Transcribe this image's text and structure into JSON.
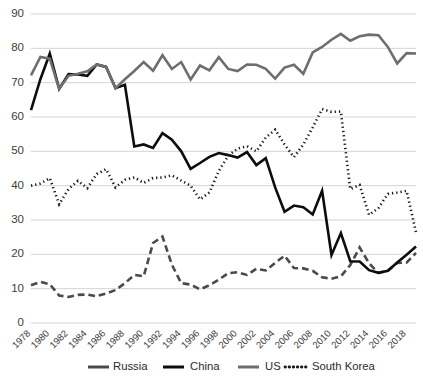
{
  "chart_data": {
    "type": "line",
    "title": "",
    "xlabel": "",
    "ylabel": "",
    "ylim": [
      0,
      90
    ],
    "ytick_step": 10,
    "grid": true,
    "legend_position": "bottom",
    "x": [
      1978,
      1979,
      1980,
      1981,
      1982,
      1983,
      1984,
      1985,
      1986,
      1987,
      1988,
      1989,
      1990,
      1991,
      1992,
      1993,
      1994,
      1995,
      1996,
      1997,
      1998,
      1999,
      2000,
      2001,
      2002,
      2003,
      2004,
      2005,
      2006,
      2007,
      2008,
      2009,
      2010,
      2011,
      2012,
      2013,
      2014,
      2015,
      2016,
      2017,
      2018,
      2019
    ],
    "xtick_labels": [
      "1978",
      "1980",
      "1982",
      "1984",
      "1986",
      "1988",
      "1990",
      "1992",
      "1994",
      "1996",
      "1998",
      "2000",
      "2002",
      "2004",
      "2006",
      "2008",
      "2010",
      "2012",
      "2014",
      "2016",
      "2018"
    ],
    "ytick_labels": [
      "0",
      "10",
      "20",
      "30",
      "40",
      "50",
      "60",
      "70",
      "80",
      "90"
    ],
    "series": [
      {
        "name": "Russia",
        "color": "#4a4a4a",
        "style": "dashed",
        "width": 2.6,
        "values": [
          11.0,
          12.0,
          11.3,
          8.0,
          7.6,
          8.2,
          8.3,
          7.8,
          8.6,
          9.6,
          11.6,
          14.0,
          13.6,
          23.3,
          25.2,
          17.0,
          11.6,
          11.2,
          9.8,
          11.0,
          12.6,
          14.5,
          14.8,
          14.0,
          15.8,
          15.3,
          17.5,
          19.6,
          16.0,
          15.9,
          15.2,
          13.3,
          12.9,
          13.6,
          16.9,
          22.0,
          17.4,
          14.6,
          15.2,
          17.5,
          17.6,
          20.4
        ]
      },
      {
        "name": "China",
        "color": "#0d0d0d",
        "style": "solid",
        "width": 2.6,
        "values": [
          62.0,
          71.0,
          78.5,
          68.2,
          72.5,
          72.4,
          72.0,
          75.3,
          74.6,
          68.4,
          69.4,
          51.4,
          52.0,
          51.0,
          55.3,
          53.4,
          50.0,
          44.9,
          46.6,
          48.4,
          49.5,
          48.9,
          48.2,
          49.8,
          46.0,
          48.0,
          39.5,
          32.4,
          34.2,
          33.7,
          31.6,
          38.5,
          19.8,
          26.2,
          18.0,
          17.9,
          15.4,
          14.6,
          15.2,
          17.6,
          19.9,
          22.3
        ]
      },
      {
        "name": "US",
        "color": "#6e6e6e",
        "style": "solid",
        "width": 2.6,
        "values": [
          72.1,
          77.5,
          77.0,
          68.2,
          72.0,
          72.6,
          73.3,
          75.3,
          74.6,
          68.4,
          71.0,
          73.4,
          76.0,
          73.5,
          78.0,
          74.0,
          76.0,
          70.9,
          75.0,
          73.6,
          77.4,
          74.0,
          73.4,
          75.3,
          75.2,
          74.0,
          71.2,
          74.4,
          75.2,
          72.6,
          78.8,
          80.4,
          82.5,
          84.2,
          82.2,
          83.5,
          84.0,
          83.8,
          80.4,
          75.6,
          78.6,
          78.5
        ]
      },
      {
        "name": "South Korea",
        "color": "#1a1a1a",
        "style": "dotted",
        "width": 2.6,
        "values": [
          40.0,
          40.6,
          42.2,
          34.6,
          39.0,
          41.4,
          39.3,
          43.4,
          44.8,
          39.5,
          41.7,
          42.4,
          40.8,
          42.2,
          42.4,
          43.0,
          41.5,
          40.0,
          36.0,
          38.0,
          44.3,
          48.7,
          50.8,
          51.5,
          50.0,
          54.0,
          56.3,
          52.0,
          48.3,
          52.0,
          57.0,
          62.3,
          61.5,
          61.6,
          39.0,
          40.2,
          31.5,
          33.5,
          37.6,
          38.0,
          38.5,
          26.4
        ]
      }
    ]
  },
  "legend": {
    "items": [
      {
        "label": "Russia"
      },
      {
        "label": "China"
      },
      {
        "label": "US"
      },
      {
        "label": "South Korea"
      }
    ]
  }
}
